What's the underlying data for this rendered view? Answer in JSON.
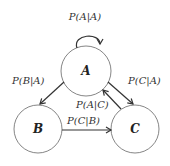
{
  "diagram": {
    "type": "state-transition",
    "nodes": [
      {
        "id": "A",
        "label": "A"
      },
      {
        "id": "B",
        "label": "B"
      },
      {
        "id": "C",
        "label": "C"
      }
    ],
    "edges": [
      {
        "from": "A",
        "to": "A",
        "label": "P(A|A)"
      },
      {
        "from": "A",
        "to": "B",
        "label": "P(B|A)"
      },
      {
        "from": "A",
        "to": "C",
        "label": "P(C|A)"
      },
      {
        "from": "C",
        "to": "A",
        "label": "P(A|C)"
      },
      {
        "from": "B",
        "to": "C",
        "label": "P(C|B)"
      }
    ]
  }
}
